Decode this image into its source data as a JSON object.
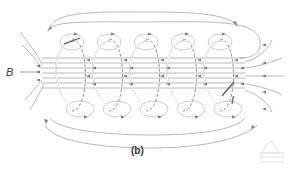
{
  "diagram": {
    "labels": {
      "field": "B",
      "current": "I"
    },
    "caption": "(b)",
    "coil_turns": 5,
    "colors": {
      "field_lines": "#9a9a9a",
      "coil": "#555555",
      "text": "#444444"
    },
    "watermark_icon": "house-watermark-icon"
  }
}
